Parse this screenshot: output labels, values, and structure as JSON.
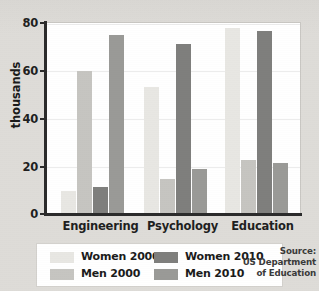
{
  "chart_data": {
    "type": "bar",
    "title": "",
    "xlabel": "",
    "ylabel": "thousands",
    "ylim": [
      0,
      80
    ],
    "yticks": [
      0,
      20,
      40,
      60,
      80
    ],
    "ytick_labels": [
      "0",
      "20",
      "40",
      "60",
      "80"
    ],
    "grid": true,
    "legend_position": "bottom",
    "categories": [
      "Engineering",
      "Psychology",
      "Education"
    ],
    "series": [
      {
        "name": "Women 2000",
        "color": "#e8e7e3",
        "values": [
          9,
          52.5,
          77
        ]
      },
      {
        "name": "Men 2000",
        "color": "#c6c5c1",
        "values": [
          59,
          14,
          22
        ]
      },
      {
        "name": "Women 2010",
        "color": "#7f7f7d",
        "values": [
          11,
          70.5,
          76
        ]
      },
      {
        "name": "Men 2010",
        "color": "#9a9a97",
        "values": [
          74,
          18.5,
          21
        ]
      }
    ],
    "annotations": [
      "Source:",
      "US Department",
      "of Education"
    ]
  },
  "axis": {
    "y_title": "thousands",
    "tick_0": "0",
    "tick_20": "20",
    "tick_40": "40",
    "tick_60": "60",
    "tick_80": "80"
  },
  "categories": {
    "engineering": "Engineering",
    "psychology": "Psychology",
    "education": "Education"
  },
  "legend": {
    "women_2000": "Women 2000",
    "men_2000": "Men 2000",
    "women_2010": "Women 2010",
    "men_2010": "Men 2010"
  },
  "source": {
    "line1": "Source:",
    "line2": "US Department",
    "line3": "of Education"
  },
  "colors": {
    "women_2000": "#e8e7e3",
    "men_2000": "#c6c5c1",
    "women_2010": "#7f7f7d",
    "men_2010": "#9a9a97",
    "page_background": "#dedcd8",
    "plot_background": "#ffffff",
    "axis": "#2b2b2b",
    "gridline": "#ececec"
  }
}
